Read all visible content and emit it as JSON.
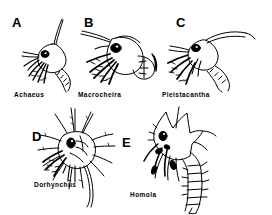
{
  "figure": {
    "background_color": "#ffffff",
    "ink_color": "#000000",
    "top_cropped_caption_artifact": "......   .    .   .  ..",
    "panels": [
      {
        "letter": "A",
        "genus": "Achaeus",
        "letter_x": 12,
        "letter_y": 16,
        "label_x": 14,
        "label_y": 92,
        "draw_x": 18,
        "draw_y": 18,
        "description": "zoea larva with rounded carapace, large dark eye, slender dorsal spine curving upward, plumose setae, segmented abdomen curving right"
      },
      {
        "letter": "B",
        "genus": "Macrocheira",
        "letter_x": 84,
        "letter_y": 16,
        "label_x": 78,
        "label_y": 92,
        "draw_x": 82,
        "draw_y": 18,
        "description": "large zoea with broad carapace, bold black eye, long thin rostral spine to upper left, heavy black plumose setae, short broad segmented abdomen"
      },
      {
        "letter": "C",
        "genus": "Pleistacantha",
        "letter_x": 176,
        "letter_y": 16,
        "label_x": 162,
        "label_y": 92,
        "draw_x": 166,
        "draw_y": 18,
        "description": "zoea with long curved dorsal spine sweeping right, dark eye, black setae, segmented tapering abdomen"
      },
      {
        "letter": "D",
        "genus": "Dorhynchus",
        "letter_x": 32,
        "letter_y": 130,
        "label_x": 34,
        "label_y": 182,
        "draw_x": 42,
        "draw_y": 108,
        "description": "spiny star-like zoea covered with numerous radiating spines in all directions, dark eye, long tail extending downward"
      },
      {
        "letter": "E",
        "genus": "Homola",
        "letter_x": 122,
        "letter_y": 136,
        "label_x": 130,
        "label_y": 192,
        "draw_x": 146,
        "draw_y": 110,
        "description": "angular carapace with pointed projections, dark eye, long prominently segmented spiny abdomen extending far downward"
      }
    ]
  }
}
